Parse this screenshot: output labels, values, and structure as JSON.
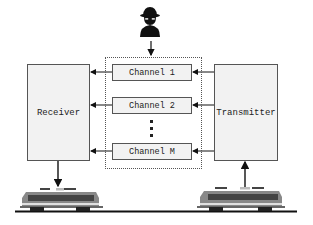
{
  "diagram": {
    "receiver": {
      "label": "Receiver"
    },
    "transmitter": {
      "label": "Transmitter"
    },
    "channels": [
      {
        "label": "Channel 1"
      },
      {
        "label": "Channel 2"
      },
      {
        "label": "Channel M"
      }
    ],
    "ellipsis_icon": "vertical-ellipsis",
    "eavesdropper_icon": "spy-icon",
    "train_icon": "locomotive-icon",
    "colors": {
      "box_fill": "#f2f2f2",
      "border": "#555555",
      "arrow": "#111111",
      "track": "#111111"
    }
  }
}
